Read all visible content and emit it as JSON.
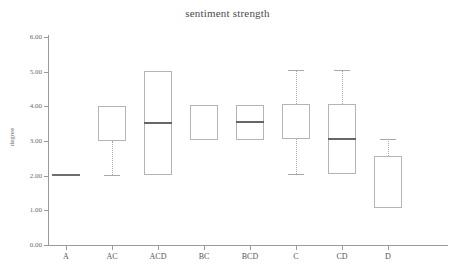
{
  "chart_data": {
    "type": "box",
    "title": "sentiment strength",
    "xlabel": "",
    "ylabel": "degree",
    "ylim": [
      0.0,
      6.0
    ],
    "y_ticks": [
      "0.00",
      "1.00",
      "2.00",
      "3.00",
      "4.00",
      "5.00",
      "6.00"
    ],
    "y_tick_values": [
      0.0,
      1.0,
      2.0,
      3.0,
      4.0,
      5.0,
      6.0
    ],
    "categories": [
      "A",
      "AC",
      "ACD",
      "BC",
      "BCD",
      "C",
      "CD",
      "D"
    ],
    "grid": false,
    "legend": null,
    "boxes": [
      {
        "category": "A",
        "whisker_low": null,
        "q1": 2.02,
        "median": 2.02,
        "q3": 2.02,
        "whisker_high": null,
        "degenerate": true
      },
      {
        "category": "AC",
        "whisker_low": 2.02,
        "q1": 3.0,
        "median": 4.02,
        "q3": 4.02,
        "whisker_high": null,
        "degenerate": false
      },
      {
        "category": "ACD",
        "whisker_low": null,
        "q1": 2.03,
        "median": 3.52,
        "q3": 5.03,
        "whisker_high": null,
        "degenerate": false
      },
      {
        "category": "BC",
        "whisker_low": null,
        "q1": 3.03,
        "median": 4.04,
        "q3": 4.04,
        "whisker_high": null,
        "degenerate": false
      },
      {
        "category": "BCD",
        "whisker_low": null,
        "q1": 3.03,
        "median": 3.55,
        "q3": 4.04,
        "whisker_high": null,
        "degenerate": false
      },
      {
        "category": "C",
        "whisker_low": 2.04,
        "q1": 3.05,
        "median": 4.06,
        "q3": 4.06,
        "whisker_high": 5.05,
        "degenerate": false
      },
      {
        "category": "CD",
        "whisker_low": null,
        "q1": 2.06,
        "median": 3.05,
        "q3": 4.06,
        "whisker_high": 5.05,
        "degenerate": false
      },
      {
        "category": "D",
        "whisker_low": null,
        "q1": 1.06,
        "median": 2.56,
        "q3": 2.56,
        "whisker_high": 3.06,
        "degenerate": false
      }
    ]
  },
  "colors": {
    "box_stroke": "#b4b4b4",
    "median": "#666666",
    "whisker": "#a8a8a8",
    "axis": "#9a9a9a",
    "text": "#555555",
    "background": "#ffffff"
  },
  "bottom_artifact": [
    "",
    "",
    "",
    ""
  ]
}
